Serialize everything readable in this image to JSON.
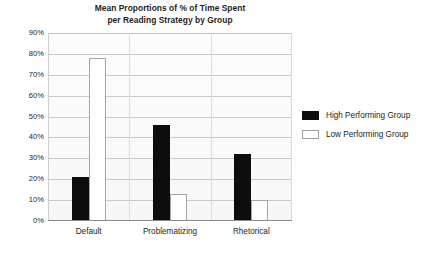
{
  "chart_data": {
    "type": "bar",
    "title": "Mean Proportions of % of Time Spent per Reading Strategy by Group",
    "title_lines": [
      "Mean Proportions of % of Time Spent",
      "per Reading Strategy by Group"
    ],
    "xlabel": "",
    "ylabel": "",
    "categories": [
      "Default",
      "Problematizing",
      "Rhetorical"
    ],
    "series": [
      {
        "name": "High Performing Group",
        "color": "#0d0d0d",
        "values": [
          21,
          46,
          32
        ]
      },
      {
        "name": "Low Performing Group",
        "color": "#ffffff",
        "values": [
          78,
          13,
          10
        ]
      }
    ],
    "ylim": [
      0,
      90
    ],
    "ytick_step": 10,
    "ytick_labels": [
      "90%",
      "80%",
      "70%",
      "60%",
      "50%",
      "40%",
      "30%",
      "20%",
      "10%",
      "0%"
    ],
    "ytick_values": [
      90,
      80,
      70,
      60,
      50,
      40,
      30,
      20,
      10,
      0
    ],
    "grid": true,
    "grid_color": "#c9c9c9",
    "legend_position": "right",
    "plot_background": "#fbfbfb"
  },
  "legend": {
    "entries": [
      {
        "label": "High Performing Group",
        "swatch": "black-filled-swatch"
      },
      {
        "label": "Low Performing Group",
        "swatch": "white-outlined-swatch"
      }
    ]
  }
}
